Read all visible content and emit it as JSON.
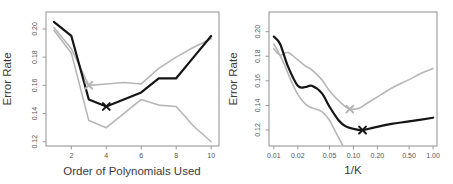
{
  "page": {
    "background": "#ffffff"
  },
  "colors": {
    "black_line": "#151515",
    "gray_line": "#b6b6b6",
    "axis_box": "#8f8f8f",
    "tick_text": "#555555",
    "label_text": "#3a3a3a"
  },
  "chart_data": [
    {
      "type": "line",
      "title": "",
      "xlabel": "Order of Polynomials Used",
      "ylabel": "Error Rate",
      "xscale": "linear",
      "xlim": [
        0.55,
        10.45
      ],
      "ylim": [
        0.117,
        0.212
      ],
      "grid": false,
      "legend": "none",
      "xticks": [
        2,
        4,
        6,
        8,
        10
      ],
      "xtick_labels": [
        "2",
        "4",
        "6",
        "8",
        "10"
      ],
      "yticks": [
        0.12,
        0.14,
        0.16,
        0.18,
        0.2
      ],
      "ytick_labels": [
        "0.12",
        "0.14",
        "0.16",
        "0.18",
        "0.20"
      ],
      "series": [
        {
          "name": "gray-line-upper",
          "color": "#b6b6b6",
          "width": 1.6,
          "smooth": false,
          "x": [
            1,
            2,
            3,
            4,
            5,
            6,
            7,
            8,
            9,
            10
          ],
          "y": [
            0.201,
            0.186,
            0.16,
            0.161,
            0.162,
            0.161,
            0.172,
            0.18,
            0.187,
            0.193
          ],
          "min_marker": {
            "x": 3,
            "y": 0.16
          }
        },
        {
          "name": "gray-line-lower",
          "color": "#b6b6b6",
          "width": 1.6,
          "smooth": false,
          "x": [
            1,
            2,
            3,
            4,
            5,
            6,
            7,
            8,
            9,
            10
          ],
          "y": [
            0.199,
            0.183,
            0.135,
            0.13,
            0.14,
            0.15,
            0.146,
            0.145,
            0.131,
            0.12
          ]
        },
        {
          "name": "black-line",
          "color": "#151515",
          "width": 2.2,
          "smooth": false,
          "x": [
            1,
            2,
            3,
            4,
            5,
            6,
            7,
            8,
            9,
            10
          ],
          "y": [
            0.205,
            0.195,
            0.15,
            0.145,
            0.15,
            0.155,
            0.165,
            0.165,
            0.18,
            0.195
          ],
          "min_marker": {
            "x": 4,
            "y": 0.145
          }
        }
      ]
    },
    {
      "type": "line",
      "title": "",
      "xlabel": "1/K",
      "ylabel": "Error Rate",
      "xscale": "log",
      "xlim": [
        0.0087,
        1.12
      ],
      "ylim": [
        0.107,
        0.216
      ],
      "grid": false,
      "legend": "none",
      "xticks": [
        0.01,
        0.02,
        0.05,
        0.1,
        0.2,
        0.5,
        1.0
      ],
      "xtick_labels": [
        "0.01",
        "0.02",
        "0.05",
        "0.10",
        "0.20",
        "0.50",
        "1.00"
      ],
      "yticks": [
        0.12,
        0.14,
        0.16,
        0.18,
        0.2
      ],
      "ytick_labels": [
        "0.12",
        "0.14",
        "0.16",
        "0.18",
        "0.20"
      ],
      "series": [
        {
          "name": "gray-line-upper",
          "color": "#b6b6b6",
          "width": 1.6,
          "smooth": true,
          "x": [
            0.01,
            0.012,
            0.015,
            0.02,
            0.025,
            0.03,
            0.04,
            0.05,
            0.07,
            0.09,
            0.12,
            0.15,
            0.2,
            0.3,
            0.5,
            0.7,
            1.0
          ],
          "y": [
            0.186,
            0.181,
            0.183,
            0.177,
            0.172,
            0.169,
            0.161,
            0.152,
            0.142,
            0.137,
            0.138,
            0.142,
            0.147,
            0.154,
            0.161,
            0.166,
            0.17
          ],
          "min_marker": {
            "x": 0.09,
            "y": 0.137
          }
        },
        {
          "name": "gray-line-lower",
          "color": "#b6b6b6",
          "width": 1.6,
          "smooth": true,
          "x": [
            0.01,
            0.013,
            0.016,
            0.02,
            0.025,
            0.03,
            0.04,
            0.05,
            0.06,
            0.07,
            0.08
          ],
          "y": [
            0.19,
            0.176,
            0.162,
            0.149,
            0.141,
            0.138,
            0.135,
            0.128,
            0.118,
            0.11,
            0.103
          ]
        },
        {
          "name": "black-line",
          "color": "#151515",
          "width": 2.2,
          "smooth": true,
          "x": [
            0.01,
            0.012,
            0.015,
            0.02,
            0.025,
            0.03,
            0.04,
            0.05,
            0.065,
            0.08,
            0.1,
            0.13,
            0.18,
            0.3,
            0.5,
            1.0
          ],
          "y": [
            0.196,
            0.19,
            0.172,
            0.156,
            0.155,
            0.156,
            0.15,
            0.139,
            0.128,
            0.123,
            0.121,
            0.12,
            0.122,
            0.125,
            0.127,
            0.13
          ],
          "min_marker": {
            "x": 0.13,
            "y": 0.12
          }
        }
      ]
    }
  ]
}
